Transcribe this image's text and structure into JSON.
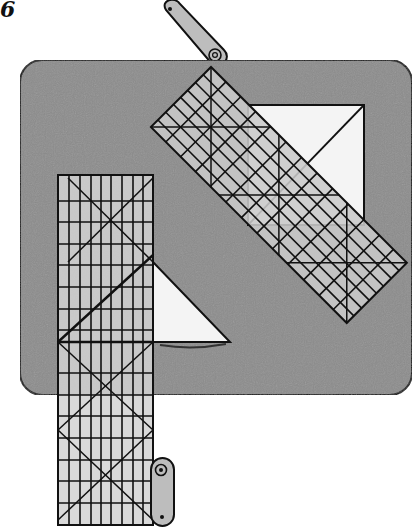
{
  "figure": {
    "label": "6"
  },
  "colors": {
    "board": "#8c8c8c",
    "ruler": "#c9c9c9",
    "fabric": "#f4f4f4",
    "ink": "#111111",
    "clip": "#bdbdbd"
  },
  "elements": {
    "board": "cutting-board",
    "ruler_vertical": "vertical-grid-ruler",
    "ruler_diagonal": "diagonal-grid-ruler",
    "fabric_square": "fabric-square-with-diagonal",
    "fabric_triangle": "fabric-half-square-triangle",
    "clip_top": "top-binder-clip",
    "clip_bottom": "bottom-binder-clip"
  }
}
